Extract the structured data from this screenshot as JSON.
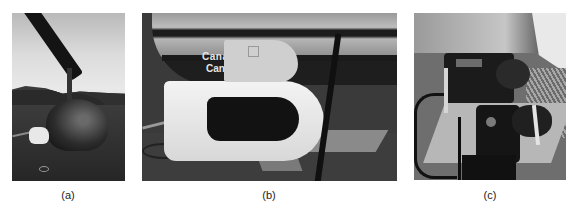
{
  "figure": {
    "panels": [
      {
        "id": "a",
        "caption": "(a)",
        "description": "Helicopter on landing pad with white sensor pod attached to side"
      },
      {
        "id": "b",
        "caption": "(b)",
        "description": "Close-up of white sensor pod with open lid mounted on helicopter skid",
        "visible_text": [
          "Canad",
          "Cany"
        ]
      },
      {
        "id": "c",
        "caption": "(c)",
        "description": "Interior of pod showing cameras mounted on plate with straps"
      }
    ]
  }
}
